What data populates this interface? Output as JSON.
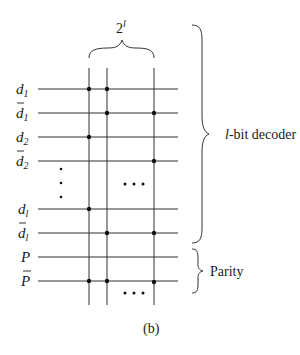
{
  "figure": {
    "caption": "(b)",
    "top_brace_label": {
      "base": "2",
      "exponent": "l"
    },
    "decoder_label": {
      "italic": "l",
      "rest": "-bit decoder"
    },
    "parity_label": "Parity",
    "row_labels": [
      {
        "name": "d",
        "sub": "1",
        "bar": false
      },
      {
        "name": "d",
        "sub": "1",
        "bar": true
      },
      {
        "name": "d",
        "sub": "2",
        "bar": false
      },
      {
        "name": "d",
        "sub": "2",
        "bar": true
      },
      {
        "name": "d",
        "sub": "l",
        "bar": false
      },
      {
        "name": "d",
        "sub": "l",
        "bar": true
      },
      {
        "name": "P",
        "sub": "",
        "bar": false
      },
      {
        "name": "P",
        "sub": "",
        "bar": true
      }
    ],
    "ellipsis": "• • •",
    "colors": {
      "ink": "#1a1a1a",
      "background": "#ffffff"
    }
  }
}
